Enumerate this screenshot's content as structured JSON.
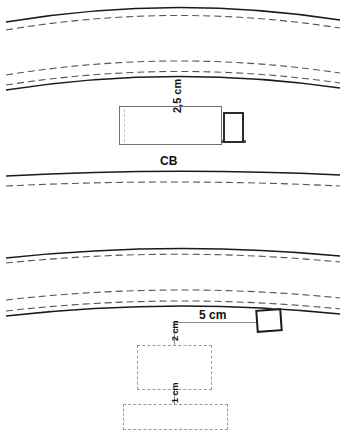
{
  "diagram": {
    "title_label": "CB",
    "labels": {
      "cb": "CB",
      "dim_2_5_cm": "2,5 cm",
      "dim_5_cm": "5 cm",
      "dim_2_cm": "2 cm",
      "dim_1_cm": "1 cm"
    },
    "colors": {
      "line": "#1a1a1a",
      "dashed_line": "#555555",
      "rect_border": "#6f6f6f",
      "dashed_rect_border": "#9a9a9a",
      "background": "#ffffff"
    },
    "annotations": [
      {
        "name": "vertical-2-5-cm",
        "text": "2,5 cm",
        "orientation": "vertical"
      },
      {
        "name": "cb-label",
        "text": "CB",
        "orientation": "horizontal"
      },
      {
        "name": "horizontal-5-cm",
        "text": "5 cm",
        "orientation": "horizontal"
      },
      {
        "name": "vertical-2-cm",
        "text": "2 cm",
        "orientation": "vertical"
      },
      {
        "name": "vertical-1-cm",
        "text": "1 cm",
        "orientation": "vertical"
      }
    ],
    "curve_bands": [
      {
        "name": "band-top",
        "lines": [
          "solid",
          "dashed"
        ]
      },
      {
        "name": "band-second",
        "lines": [
          "dashed",
          "dashed",
          "solid"
        ]
      },
      {
        "name": "band-below-cb",
        "lines": [
          "solid",
          "dashed"
        ]
      },
      {
        "name": "band-middle",
        "lines": [
          "solid",
          "dashed"
        ]
      },
      {
        "name": "band-lower",
        "lines": [
          "dashed",
          "dashed",
          "solid"
        ]
      }
    ],
    "shapes": [
      {
        "name": "main-body-rect",
        "style": "solid",
        "width_label": "2,5 cm"
      },
      {
        "name": "attachment-square",
        "style": "solid-bold"
      },
      {
        "name": "tilted-square",
        "style": "solid-bold",
        "distance_label": "5 cm"
      },
      {
        "name": "dashed-rect-upper",
        "style": "dashed",
        "offset_label": "2 cm"
      },
      {
        "name": "dashed-rect-lower",
        "style": "dashed",
        "offset_label": "1 cm"
      }
    ]
  }
}
